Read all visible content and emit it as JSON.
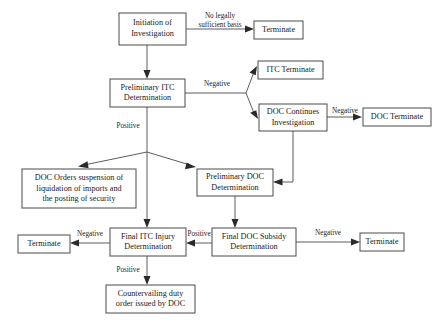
{
  "diagram": {
    "type": "flowchart",
    "canvas": {
      "width": 445,
      "height": 322
    },
    "colors": {
      "background": "#ffffff",
      "box_border": "#4a4a4a",
      "box_fill": "#ffffff",
      "text": "#1a1a1a",
      "arrow": "#2a2a2a"
    },
    "nodes": [
      {
        "id": "initiation",
        "lines": [
          "Initiation of",
          "Investigation"
        ],
        "x": 119,
        "y": 13,
        "w": 67,
        "h": 32
      },
      {
        "id": "terminate_top",
        "lines": [
          "Terminate"
        ],
        "x": 254,
        "y": 21,
        "w": 49,
        "h": 18
      },
      {
        "id": "prelim_itc",
        "lines": [
          "Preliminary ITC",
          "Determination"
        ],
        "x": 110,
        "y": 79,
        "w": 75,
        "h": 28
      },
      {
        "id": "itc_terminate",
        "lines": [
          "ITC Terminate"
        ],
        "x": 258,
        "y": 61,
        "w": 65,
        "h": 18
      },
      {
        "id": "doc_continues",
        "lines": [
          "DOC Continues",
          "Investigation"
        ],
        "x": 259,
        "y": 104,
        "w": 68,
        "h": 27
      },
      {
        "id": "doc_terminate",
        "lines": [
          "DOC Terminate"
        ],
        "x": 363,
        "y": 108,
        "w": 68,
        "h": 18
      },
      {
        "id": "doc_orders",
        "lines": [
          "DOC Orders suspension of",
          "liquidation of imports and",
          "the posting of security"
        ],
        "x": 22,
        "y": 169,
        "w": 114,
        "h": 39
      },
      {
        "id": "prelim_doc",
        "lines": [
          "Preliminary DOC",
          "Determination"
        ],
        "x": 197,
        "y": 169,
        "w": 76,
        "h": 27
      },
      {
        "id": "terminate_left",
        "lines": [
          "Terminate"
        ],
        "x": 18,
        "y": 235,
        "w": 52,
        "h": 18
      },
      {
        "id": "final_itc",
        "lines": [
          "Final ITC Injury",
          "Determination"
        ],
        "x": 110,
        "y": 228,
        "w": 76,
        "h": 28
      },
      {
        "id": "final_doc",
        "lines": [
          "Final DOC Subsidy",
          "Determination"
        ],
        "x": 212,
        "y": 228,
        "w": 84,
        "h": 28
      },
      {
        "id": "terminate_right",
        "lines": [
          "Terminate"
        ],
        "x": 360,
        "y": 233,
        "w": 44,
        "h": 18
      },
      {
        "id": "cvd_order",
        "lines": [
          "Countervailing duty",
          "order issued by DOC"
        ],
        "x": 106,
        "y": 285,
        "w": 89,
        "h": 28
      }
    ],
    "edges": [
      {
        "id": "initiation-to-terminate",
        "from": "initiation",
        "to": "terminate_top",
        "label": "No legally\nsufficient basis",
        "label_line1": "No legally",
        "label_line2": "sufficient basis",
        "label_x": 220,
        "label_y": 16
      },
      {
        "id": "initiation-to-prelim-itc",
        "from": "initiation",
        "to": "prelim_itc",
        "label": ""
      },
      {
        "id": "prelim-itc-negative",
        "from": "prelim_itc",
        "to": "itc_terminate",
        "label": "Negative",
        "label_x": 217,
        "label_y": 84
      },
      {
        "id": "prelim-itc-negative-doc",
        "from": "prelim_itc",
        "to": "doc_continues",
        "label": ""
      },
      {
        "id": "doc-continues-negative",
        "from": "doc_continues",
        "to": "doc_terminate",
        "label": "Negative",
        "label_x": 345,
        "label_y": 111
      },
      {
        "id": "prelim-itc-positive",
        "from": "prelim_itc",
        "to": "split",
        "label": "Positive",
        "label_x": 128,
        "label_y": 126
      },
      {
        "id": "split-to-doc-orders",
        "from": "split",
        "to": "doc_orders",
        "label": ""
      },
      {
        "id": "split-to-prelim-doc",
        "from": "split",
        "to": "prelim_doc",
        "label": ""
      },
      {
        "id": "doc-continues-to-prelim-doc",
        "from": "doc_continues",
        "to": "prelim_doc",
        "label": ""
      },
      {
        "id": "split-to-final-itc",
        "from": "split",
        "to": "final_itc",
        "label": ""
      },
      {
        "id": "prelim-doc-to-final-doc",
        "from": "prelim_doc",
        "to": "final_doc",
        "label": ""
      },
      {
        "id": "final-itc-negative",
        "from": "final_itc",
        "to": "terminate_left",
        "label": "Negative",
        "label_x": 90,
        "label_y": 234
      },
      {
        "id": "final-doc-to-final-itc",
        "from": "final_doc",
        "to": "final_itc",
        "label": "Positive",
        "label_x": 199,
        "label_y": 234
      },
      {
        "id": "final-doc-negative",
        "from": "final_doc",
        "to": "terminate_right",
        "label": "Negative",
        "label_x": 328,
        "label_y": 233
      },
      {
        "id": "final-itc-positive",
        "from": "final_itc",
        "to": "cvd_order",
        "label": "Positive",
        "label_x": 128,
        "label_y": 270
      }
    ]
  }
}
